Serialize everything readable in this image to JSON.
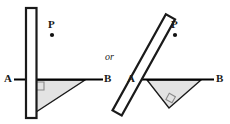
{
  "figure": {
    "canvas": {
      "width": 230,
      "height": 124,
      "background": "#ffffff"
    },
    "colors": {
      "stroke": "#1a1a1a",
      "bar_fill": "#ffffff",
      "triangle_fill": "#e3e3e3",
      "line": "#000000",
      "text": "#1a1a1a"
    },
    "connector_text": "or",
    "diagrams": [
      {
        "id": "left-diagram",
        "name": "vertical-bar-diagram",
        "bar": {
          "name": "vertical-bar",
          "orientation": "vertical",
          "x": 26,
          "y": 8,
          "width": 10,
          "height": 110,
          "rotation_deg": 0
        },
        "line_AB": {
          "x1": 14,
          "y1": 79,
          "x2": 103,
          "y2": 79
        },
        "triangle": {
          "points": "33,80 85,80 33,114",
          "fill": "#e3e3e3"
        },
        "right_angle_marker": {
          "x": 35,
          "y": 82,
          "size": 8
        },
        "labels": {
          "A": {
            "text": "A",
            "x": 5,
            "y": 73
          },
          "B": {
            "text": "B",
            "x": 105,
            "y": 73
          },
          "P": {
            "text": "P",
            "x": 48,
            "y": 19
          }
        },
        "point_P": {
          "cx": 52,
          "cy": 35,
          "r": 2.1
        }
      },
      {
        "id": "right-diagram",
        "name": "tilted-bar-diagram",
        "bar": {
          "name": "tilted-bar",
          "orientation": "tilted",
          "x": 139,
          "y": 10,
          "width": 10,
          "height": 110,
          "rotation_deg": 29
        },
        "line_AB": {
          "x1": 138,
          "y1": 79,
          "x2": 214,
          "y2": 79
        },
        "triangle": {
          "points": "147,80 200,80 168,108",
          "fill": "#e3e3e3"
        },
        "right_angle_marker": {
          "x": 166,
          "y": 95,
          "size": 7,
          "rotation_deg": 29
        },
        "labels": {
          "A": {
            "text": "A",
            "x": 128,
            "y": 73
          },
          "B": {
            "text": "B",
            "x": 216,
            "y": 73
          },
          "P": {
            "text": "P",
            "x": 171,
            "y": 19
          }
        },
        "point_P": {
          "cx": 175,
          "cy": 35,
          "r": 2.1
        }
      }
    ]
  }
}
